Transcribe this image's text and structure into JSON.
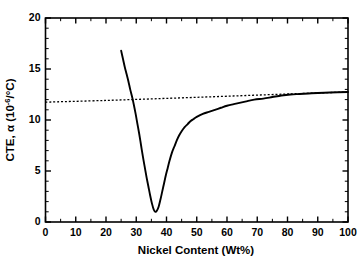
{
  "chart_data": {
    "type": "line",
    "title": "",
    "xlabel": "Nickel Content (Wt%)",
    "ylabel_parts": {
      "lead": "CTE, ",
      "symbol": "α",
      "units_open": " (10",
      "units_exp": "-6",
      "units_close": "/°C)"
    },
    "ylabel": "CTE, α (10-6/°C)",
    "xlim": [
      0,
      100
    ],
    "ylim": [
      0,
      20
    ],
    "xticks": [
      0,
      10,
      20,
      30,
      40,
      50,
      60,
      70,
      80,
      90,
      100
    ],
    "xtick_labels": [
      "0",
      "10",
      "20",
      "30",
      "40",
      "50",
      "60",
      "70",
      "80",
      "90",
      "100"
    ],
    "yticks": [
      0,
      5,
      10,
      15,
      20
    ],
    "ytick_labels": [
      "0",
      "5",
      "10",
      "15",
      "20"
    ],
    "x_minor_step": 5,
    "y_minor_step": 1,
    "grid": false,
    "legend": null,
    "tick_direction": "in",
    "colors": {
      "axis": "#000000",
      "series_measured": "#000000",
      "series_rule": "#000000",
      "background": "#ffffff"
    },
    "series": [
      {
        "name": "CTE of Fe-Ni alloy (measured)",
        "style": "solid",
        "points": [
          [
            25.0,
            16.8
          ],
          [
            25.6,
            16.0
          ],
          [
            26.2,
            15.2
          ],
          [
            26.8,
            14.5
          ],
          [
            27.4,
            13.8
          ],
          [
            28.0,
            13.0
          ],
          [
            28.6,
            12.3
          ],
          [
            29.2,
            11.5
          ],
          [
            29.8,
            10.6
          ],
          [
            30.4,
            9.6
          ],
          [
            31.0,
            8.6
          ],
          [
            31.6,
            7.5
          ],
          [
            32.2,
            6.4
          ],
          [
            32.8,
            5.4
          ],
          [
            33.4,
            4.4
          ],
          [
            34.0,
            3.5
          ],
          [
            34.6,
            2.6
          ],
          [
            35.2,
            1.8
          ],
          [
            35.8,
            1.2
          ],
          [
            36.3,
            1.0
          ],
          [
            36.8,
            1.1
          ],
          [
            37.4,
            1.5
          ],
          [
            38.0,
            2.2
          ],
          [
            38.6,
            3.0
          ],
          [
            39.2,
            3.8
          ],
          [
            39.8,
            4.6
          ],
          [
            40.4,
            5.3
          ],
          [
            41.0,
            6.0
          ],
          [
            41.8,
            6.8
          ],
          [
            42.6,
            7.4
          ],
          [
            43.4,
            8.0
          ],
          [
            44.2,
            8.5
          ],
          [
            45.0,
            8.9
          ],
          [
            46.0,
            9.3
          ],
          [
            47.0,
            9.6
          ],
          [
            48.0,
            9.9
          ],
          [
            49.0,
            10.1
          ],
          [
            50.0,
            10.3
          ],
          [
            52.0,
            10.6
          ],
          [
            54.0,
            10.8
          ],
          [
            56.0,
            11.0
          ],
          [
            58.0,
            11.2
          ],
          [
            60.0,
            11.4
          ],
          [
            63.0,
            11.6
          ],
          [
            66.0,
            11.8
          ],
          [
            69.0,
            12.0
          ],
          [
            72.0,
            12.1
          ],
          [
            75.0,
            12.25
          ],
          [
            78.0,
            12.4
          ],
          [
            81.0,
            12.5
          ],
          [
            84.0,
            12.55
          ],
          [
            87.0,
            12.6
          ],
          [
            90.0,
            12.65
          ],
          [
            94.0,
            12.7
          ],
          [
            100.0,
            12.75
          ]
        ]
      },
      {
        "name": "Rule of mixtures (linear baseline)",
        "style": "dotted",
        "points": [
          [
            0.0,
            11.75
          ],
          [
            20.0,
            11.92
          ],
          [
            40.0,
            12.12
          ],
          [
            60.0,
            12.33
          ],
          [
            80.0,
            12.55
          ],
          [
            100.0,
            12.75
          ]
        ]
      }
    ],
    "annotations": [
      {
        "text": "minimum",
        "x": 36.3,
        "y": 1.0
      },
      {
        "text": "curve-start",
        "x": 25.0,
        "y": 16.8
      },
      {
        "text": "crossover",
        "x": 29.0,
        "y": 12.0
      }
    ]
  }
}
